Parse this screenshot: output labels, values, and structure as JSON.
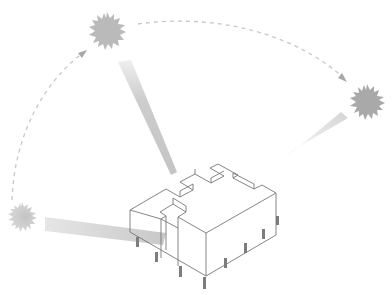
{
  "diagram": {
    "type": "sun-path-architectural-diagram",
    "background": "#ffffff",
    "colors": {
      "sun_fill": "#b8b8b8",
      "sun_fill_dark": "#a9a9a9",
      "arc_dash": "#c4c4c4",
      "ray_start": "#cfcfcf",
      "ray_end": "#eeeeee",
      "building_line": "#6e6e6e",
      "column_fill": "#7a7a7a"
    },
    "suns": [
      {
        "id": "sun-morning",
        "cx": 22,
        "cy": 217,
        "r": 15
      },
      {
        "id": "sun-noon",
        "cx": 107,
        "cy": 31,
        "r": 19
      },
      {
        "id": "sun-evening",
        "cx": 367,
        "cy": 102,
        "r": 18
      }
    ],
    "arcs": [
      {
        "id": "arc-morning-to-noon",
        "path": "M 12 200 C 14 140, 40 85, 84 52",
        "arrow_at": [
          84,
          52
        ]
      },
      {
        "id": "arc-noon-to-evening",
        "path": "M 138 24 C 210 14, 290 30, 345 80",
        "arrow_at": [
          345,
          80
        ]
      }
    ],
    "rays": [
      {
        "id": "ray-morning",
        "points": "45,218 45,232 162,243 166,232"
      },
      {
        "id": "ray-noon",
        "points": "118,62 130,60 176,172 171,174"
      },
      {
        "id": "ray-evening",
        "points": "284,158 292,150 346,116 340,112"
      }
    ],
    "building": {
      "label": "isometric building on pilotis",
      "column_count": 8
    }
  }
}
